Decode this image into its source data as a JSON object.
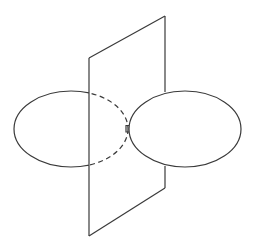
{
  "diagram": {
    "colors": {
      "background": "#ffffff",
      "line": "#3a3a3a"
    },
    "plane": {
      "points": [
        [
          89,
          58
        ],
        [
          165,
          16
        ],
        [
          165,
          188
        ],
        [
          89,
          236
        ]
      ],
      "hidden_segment_right_edge": [
        [
          165,
          92
        ],
        [
          165,
          166
        ]
      ]
    },
    "left_ellipse": {
      "cx": 71,
      "cy": 129,
      "rx": 57,
      "ry": 38,
      "dashed_part": "x > 89"
    },
    "right_ellipse": {
      "cx": 185,
      "cy": 129,
      "rx": 56,
      "ry": 38
    },
    "tangent_mark": {
      "x": 127,
      "y": 129
    }
  }
}
